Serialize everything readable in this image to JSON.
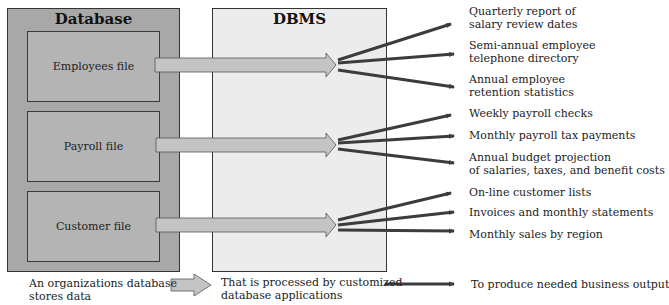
{
  "database": {
    "title": "Database",
    "files": [
      {
        "label": "Employees file"
      },
      {
        "label": "Payroll file"
      },
      {
        "label": "Customer file"
      }
    ]
  },
  "dbms": {
    "title": "DBMS"
  },
  "outputs": {
    "employees": [
      {
        "line1": "Quarterly report of",
        "line2": "salary review dates"
      },
      {
        "line1": "Semi-annual employee",
        "line2": "telephone directory"
      },
      {
        "line1": "Annual employee",
        "line2": "retention statistics"
      }
    ],
    "payroll": [
      {
        "line1": "Weekly payroll checks",
        "line2": ""
      },
      {
        "line1": "Monthly payroll tax payments",
        "line2": ""
      },
      {
        "line1": "Annual budget projection",
        "line2": "of salaries, taxes, and benefit costs"
      }
    ],
    "customer": [
      {
        "line1": "On-line customer lists",
        "line2": ""
      },
      {
        "line1": "Invoices and monthly statements",
        "line2": ""
      },
      {
        "line1": "Monthly sales by region",
        "line2": ""
      }
    ]
  },
  "legend": {
    "stores": {
      "line1": "An organizations database",
      "line2": "stores data"
    },
    "processed": {
      "line1": "That is processed by customized",
      "line2": "database applications"
    },
    "output": {
      "line1": "To produce needed business output"
    }
  },
  "colors": {
    "database_bg": "#a8a8a8",
    "file_bg": "#b4b4b4",
    "dbms_bg": "#ececec",
    "flow_arrow": "#c4c4c4",
    "output_arrow": "#3c3c3c"
  }
}
